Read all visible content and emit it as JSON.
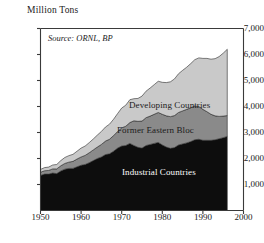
{
  "axis_title": "Million Tons",
  "source_note": "Source: ORNL, BP",
  "labels": {
    "developing": "Developing Countries",
    "former_eastern_bloc": "Former Eastern Bloc",
    "industrial": "Industrial Countries"
  },
  "colors": {
    "industrial": "#0d0d0d",
    "former_eastern_bloc": "#8a8a8a",
    "developing": "#c9c9c9",
    "axis": "#3a3a3a",
    "background": "#ffffff"
  },
  "yticks": [
    "1,000",
    "2,000",
    "3,000",
    "4,000",
    "5,000",
    "6,000",
    "7,000"
  ],
  "xticks": [
    "1950",
    "1960",
    "1970",
    "1980",
    "1990",
    "2000"
  ],
  "chart_data": {
    "type": "area",
    "title": "Million Tons",
    "subtitle": "Source: ORNL, BP",
    "xlabel": "",
    "ylabel": "Million Tons",
    "stacked": true,
    "grid": false,
    "legend_position": "inline-on-bands",
    "xlim": [
      1950,
      2000
    ],
    "ylim": [
      0,
      7000
    ],
    "ytick_values": [
      1000,
      2000,
      3000,
      4000,
      5000,
      6000,
      7000
    ],
    "xtick_values": [
      1950,
      1960,
      1970,
      1980,
      1990,
      2000
    ],
    "x": [
      1950,
      1951,
      1952,
      1953,
      1954,
      1955,
      1956,
      1957,
      1958,
      1959,
      1960,
      1961,
      1962,
      1963,
      1964,
      1965,
      1966,
      1967,
      1968,
      1969,
      1970,
      1971,
      1972,
      1973,
      1974,
      1975,
      1976,
      1977,
      1978,
      1979,
      1980,
      1981,
      1982,
      1983,
      1984,
      1985,
      1986,
      1987,
      1988,
      1989,
      1990,
      1991,
      1992,
      1993,
      1994,
      1995,
      1996
    ],
    "series": [
      {
        "name": "Industrial Countries",
        "color": "#0d0d0d",
        "values": [
          1350,
          1400,
          1400,
          1440,
          1420,
          1520,
          1590,
          1620,
          1620,
          1680,
          1740,
          1770,
          1840,
          1920,
          2000,
          2060,
          2150,
          2180,
          2280,
          2400,
          2480,
          2500,
          2580,
          2500,
          2430,
          2400,
          2500,
          2540,
          2580,
          2620,
          2520,
          2440,
          2390,
          2420,
          2520,
          2560,
          2600,
          2650,
          2720,
          2740,
          2700,
          2700,
          2700,
          2720,
          2760,
          2800,
          2850
        ]
      },
      {
        "name": "Former Eastern Bloc",
        "color": "#8a8a8a",
        "values": [
          120,
          130,
          140,
          160,
          180,
          200,
          220,
          240,
          270,
          300,
          320,
          350,
          380,
          410,
          440,
          480,
          520,
          560,
          600,
          640,
          700,
          740,
          800,
          950,
          1000,
          1040,
          1070,
          1090,
          1120,
          1150,
          1180,
          1200,
          1220,
          1230,
          1250,
          1270,
          1290,
          1300,
          1300,
          1260,
          1190,
          1100,
          1000,
          920,
          860,
          830,
          800
        ]
      },
      {
        "name": "Developing Countries",
        "color": "#c9c9c9",
        "values": [
          110,
          120,
          130,
          150,
          170,
          200,
          230,
          250,
          270,
          300,
          340,
          360,
          390,
          420,
          460,
          500,
          540,
          580,
          630,
          690,
          760,
          810,
          880,
          850,
          880,
          960,
          1020,
          1080,
          1140,
          1200,
          1230,
          1280,
          1340,
          1410,
          1490,
          1560,
          1620,
          1700,
          1780,
          1870,
          1960,
          2050,
          2120,
          2200,
          2300,
          2420,
          2550
        ]
      }
    ]
  }
}
